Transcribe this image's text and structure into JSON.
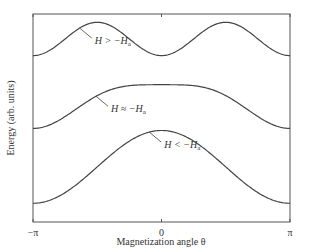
{
  "chart_data": {
    "type": "line",
    "title": "",
    "xlabel": "Magnetization angle θ",
    "ylabel": "Energy (arb. units)",
    "xlim": [
      -3.14159,
      3.14159
    ],
    "ylim": [
      0,
      1
    ],
    "x_ticks": [
      {
        "value": -3.14159,
        "label": "−π"
      },
      {
        "value": 0,
        "label": "0"
      },
      {
        "value": 3.14159,
        "label": "π"
      }
    ],
    "grid": false,
    "series": [
      {
        "name": "H > −Ha",
        "label_main": "H > −H",
        "label_sub": "a",
        "formula": "offset + amp*sin^2(theta)",
        "offset": 0.8,
        "amp": 0.16,
        "kind": "sin2"
      },
      {
        "name": "H ≈ −Ha",
        "label_main": "H ≈ −H",
        "label_sub": "a",
        "formula": "offset + amp*cos^4-ish flat top",
        "offset": 0.45,
        "amp": 0.21,
        "kind": "flat"
      },
      {
        "name": "H < −Ha",
        "label_main": "H < −H",
        "label_sub": "a",
        "formula": "offset + amp*cos^2(theta/2)",
        "offset": 0.09,
        "amp": 0.35,
        "kind": "cos2half"
      }
    ],
    "annotations": [
      {
        "series": 0,
        "text": "H > −Ha",
        "at_theta": -2.0
      },
      {
        "series": 1,
        "text": "H ≈ −Ha",
        "at_theta": -1.6
      },
      {
        "series": 2,
        "text": "H < −Ha",
        "at_theta": -0.3
      }
    ]
  }
}
